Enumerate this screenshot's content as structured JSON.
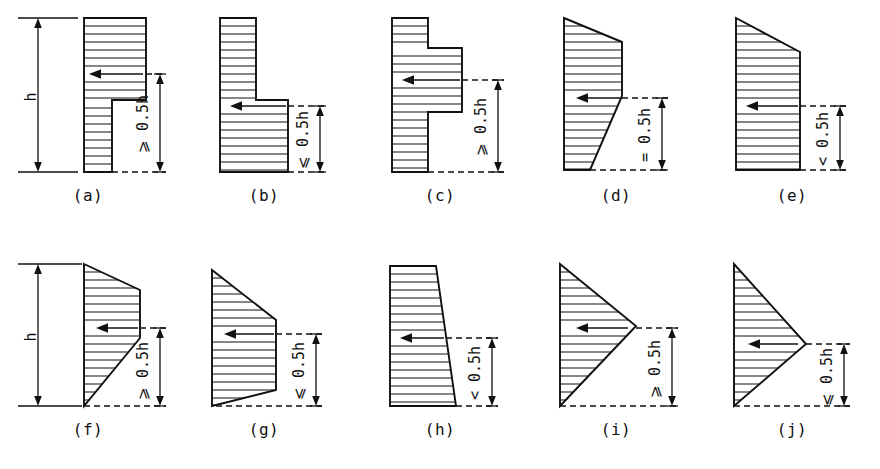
{
  "figure": {
    "height_symbol": "h",
    "panels": [
      {
        "id": "a",
        "caption": "(a)",
        "dim_label": "⩾ 0•0 5h",
        "dim_label_text": "⩾ 0.5h",
        "shape": "stepped: wide upper block over narrow lower block",
        "arrow_direction": "left",
        "has_height_dimension": true
      },
      {
        "id": "b",
        "caption": "(b)",
        "dim_label_text": "⩽ 0.5h",
        "shape": "stepped: narrow upper block over wide lower block",
        "arrow_direction": "left",
        "has_height_dimension": false
      },
      {
        "id": "c",
        "caption": "(c)",
        "dim_label_text": "⩾ 0.5h",
        "shape": "narrow top, wide middle bulge, narrow bottom",
        "arrow_direction": "left",
        "has_height_dimension": false
      },
      {
        "id": "d",
        "caption": "(d)",
        "dim_label_text": "= 0.5h",
        "shape": "trapezoid widest at mid-height tapering down",
        "arrow_direction": "left",
        "has_height_dimension": false
      },
      {
        "id": "e",
        "caption": "(e)",
        "dim_label_text": "< 0.5h",
        "shape": "chamfered top-right corner, straight right edge",
        "arrow_direction": "left",
        "has_height_dimension": false
      },
      {
        "id": "f",
        "caption": "(f)",
        "dim_label_text": "⩾ 0.5h",
        "shape": "widest band mid-upper, tapering to point at bottom-left",
        "arrow_direction": "left",
        "has_height_dimension": true
      },
      {
        "id": "g",
        "caption": "(g)",
        "dim_label_text": "⩽ 0.5h",
        "shape": "widest band mid, tapering to point at bottom-left",
        "arrow_direction": "left",
        "has_height_dimension": false
      },
      {
        "id": "h",
        "caption": "(h)",
        "dim_label_text": "< 0.5h",
        "shape": "trapezoid widening toward the bottom",
        "arrow_direction": "left",
        "has_height_dimension": false
      },
      {
        "id": "i",
        "caption": "(i)",
        "dim_label_text": "⩾ 0.5h",
        "shape": "triangle apex pointing right at upper-mid height",
        "arrow_direction": "left",
        "has_height_dimension": false
      },
      {
        "id": "j",
        "caption": "(j)",
        "dim_label_text": "⩽ 0.5h",
        "shape": "triangle apex pointing right at lower-mid height",
        "arrow_direction": "left",
        "has_height_dimension": false
      }
    ],
    "colors": {
      "ink": "#111111",
      "background": "#ffffff"
    }
  }
}
